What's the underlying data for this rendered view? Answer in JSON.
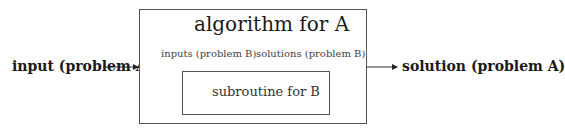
{
  "diagram": {
    "input_label": "input (problem A)",
    "output_label": "solution (problem A)",
    "outer_box": {
      "title": "algorithm for A"
    },
    "inner_box": {
      "title": "subroutine for B"
    },
    "down_arrow_label": "inputs (problem B)",
    "up_arrow_label": "solutions (problem B)"
  },
  "colors": {
    "line": "#333333",
    "box_border": "#555555",
    "text": "#1a1a1a"
  }
}
